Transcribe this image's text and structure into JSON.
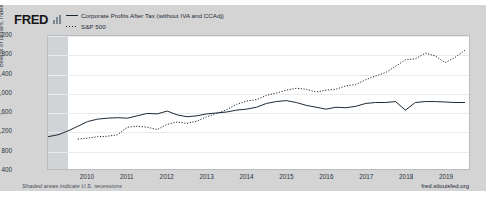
{
  "brand": {
    "name": "FRED",
    "mark_icon": "bar-chart-icon"
  },
  "legend": [
    {
      "label": "Corporate Profits After Tax (without IVA and CCAdj)",
      "style": "solid",
      "color": "#1a2734"
    },
    {
      "label": "S&P 500",
      "style": "dotted",
      "color": "#1a2734"
    }
  ],
  "footer": {
    "note": "Shaded areas indicate U.S. recessions",
    "source": "fred.stlouisfed.org"
  },
  "chart_data": {
    "type": "line",
    "title": "",
    "xlabel": "",
    "ylabel": "Billions of Dollars, Index",
    "ylim": [
      400,
      3200
    ],
    "yticks": [
      "3,200",
      "2,800",
      "2,400",
      "2,000",
      "1,600",
      "1,200",
      "800",
      "400"
    ],
    "ytick_values": [
      3200,
      2800,
      2400,
      2000,
      1600,
      1200,
      800,
      400
    ],
    "xlim": [
      2009.0,
      2019.6
    ],
    "xticks": [
      "2010",
      "2011",
      "2012",
      "2013",
      "2014",
      "2015",
      "2016",
      "2017",
      "2018",
      "2019"
    ],
    "xtick_values": [
      2010,
      2011,
      2012,
      2013,
      2014,
      2015,
      2016,
      2017,
      2018,
      2019
    ],
    "grid": true,
    "legend_position": "top-left",
    "shaded_regions": [
      {
        "label": "U.S. recession",
        "x_start": 2009.0,
        "x_end": 2009.5,
        "color": "#c9ccd0"
      }
    ],
    "series": [
      {
        "name": "Corporate Profits After Tax (without IVA and CCAdj)",
        "style": "solid",
        "color": "#1a2734",
        "x": [
          2009.0,
          2009.25,
          2009.5,
          2009.75,
          2010.0,
          2010.25,
          2010.5,
          2010.75,
          2011.0,
          2011.25,
          2011.5,
          2011.75,
          2012.0,
          2012.25,
          2012.5,
          2012.75,
          2013.0,
          2013.25,
          2013.5,
          2013.75,
          2014.0,
          2014.25,
          2014.5,
          2014.75,
          2015.0,
          2015.25,
          2015.5,
          2015.75,
          2016.0,
          2016.25,
          2016.5,
          2016.75,
          2017.0,
          2017.25,
          2017.5,
          2017.75,
          2018.0,
          2018.25,
          2018.5,
          2018.75,
          2019.0,
          2019.25,
          2019.5
        ],
        "y": [
          1080,
          1120,
          1200,
          1300,
          1400,
          1450,
          1470,
          1480,
          1470,
          1520,
          1570,
          1560,
          1620,
          1540,
          1500,
          1520,
          1560,
          1580,
          1600,
          1640,
          1660,
          1700,
          1780,
          1820,
          1840,
          1800,
          1740,
          1700,
          1660,
          1700,
          1690,
          1720,
          1780,
          1800,
          1800,
          1820,
          1640,
          1800,
          1820,
          1820,
          1810,
          1800,
          1800
        ]
      },
      {
        "name": "S&P 500",
        "style": "dotted",
        "color": "#1a2734",
        "x": [
          2009.75,
          2010.0,
          2010.25,
          2010.5,
          2010.75,
          2011.0,
          2011.25,
          2011.5,
          2011.75,
          2012.0,
          2012.25,
          2012.5,
          2012.75,
          2013.0,
          2013.25,
          2013.5,
          2013.75,
          2014.0,
          2014.25,
          2014.5,
          2014.75,
          2015.0,
          2015.25,
          2015.5,
          2015.75,
          2016.0,
          2016.25,
          2016.5,
          2016.75,
          2017.0,
          2017.25,
          2017.5,
          2017.75,
          2018.0,
          2018.25,
          2018.5,
          2018.75,
          2019.0,
          2019.25,
          2019.5
        ],
        "y": [
          1030,
          1050,
          1080,
          1090,
          1120,
          1280,
          1300,
          1280,
          1230,
          1340,
          1390,
          1360,
          1410,
          1500,
          1570,
          1650,
          1760,
          1830,
          1860,
          1950,
          2000,
          2060,
          2100,
          2080,
          2020,
          2060,
          2080,
          2150,
          2180,
          2280,
          2360,
          2430,
          2560,
          2700,
          2720,
          2840,
          2780,
          2640,
          2750,
          2900
        ]
      }
    ]
  }
}
